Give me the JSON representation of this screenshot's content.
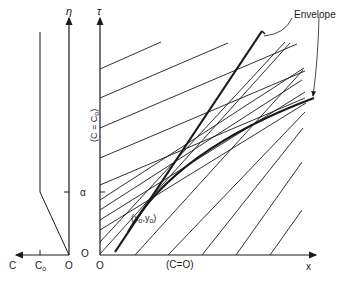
{
  "diagram": {
    "left_panel": {
      "vertical_axis_label": "η",
      "horizontal_axis_label": "C",
      "tick_c0": "C",
      "tick_c0_sub": "o",
      "origin_label": "O",
      "tick_alpha": "α",
      "origin_eta_label": "O"
    },
    "right_panel": {
      "vertical_axis_label": "τ",
      "horizontal_axis_label": "x",
      "origin_label": "O",
      "tau_axis_condition": "(C = C",
      "tau_axis_condition_sub": "o",
      "tau_axis_condition_close": ")",
      "x_axis_condition": "(C=O)",
      "point_label": "(x",
      "point_label_sub1": "o",
      "point_label_mid": ",y",
      "point_label_sub2": "o",
      "point_label_close": ")",
      "envelope_label": "Envelope"
    },
    "colors": {
      "line": "#1a1a1a",
      "background": "#ffffff"
    }
  }
}
